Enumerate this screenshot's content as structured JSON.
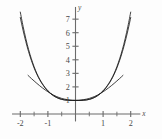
{
  "chart_data": {
    "type": "line",
    "title": "",
    "subtitle": "",
    "xlabel": "x",
    "ylabel": "y",
    "xlim": [
      -2.3,
      2.35
    ],
    "ylim": [
      -0.55,
      7.9
    ],
    "grid": false,
    "legend": "none",
    "x_ticks_major": [
      -2,
      -1,
      1,
      2
    ],
    "x_tick_labels": [
      "-2",
      "-1",
      "1",
      "2"
    ],
    "x_ticks_minor": [
      -1.5,
      -0.5,
      0.5,
      1.5
    ],
    "y_ticks_major": [
      1,
      2,
      3,
      4,
      5,
      6,
      7
    ],
    "y_tick_labels": [
      "1",
      "2",
      "3",
      "4",
      "5",
      "6",
      "7"
    ],
    "annotations": [
      {
        "name": "common-point",
        "x": 0,
        "y": 1,
        "text": ""
      }
    ],
    "series": [
      {
        "name": "curve-outer",
        "color": "#1d1d1d",
        "x": [
          -2.0,
          -1.9,
          -1.8,
          -1.7,
          -1.6,
          -1.5,
          -1.4,
          -1.3,
          -1.2,
          -1.1,
          -1.0,
          -0.9,
          -0.8,
          -0.7,
          -0.6,
          -0.5,
          -0.4,
          -0.3,
          -0.2,
          -0.1,
          0.0,
          0.1,
          0.2,
          0.3,
          0.4,
          0.5,
          0.6,
          0.7,
          0.8,
          0.9,
          1.0,
          1.1,
          1.2,
          1.3,
          1.4,
          1.5,
          1.6,
          1.7,
          1.8,
          1.9,
          2.0
        ],
        "y": [
          7.52,
          6.48,
          5.56,
          4.76,
          4.08,
          3.49,
          2.99,
          2.58,
          2.24,
          1.95,
          1.72,
          1.52,
          1.36,
          1.24,
          1.15,
          1.08,
          1.04,
          1.02,
          1.01,
          1.0,
          1.0,
          1.0,
          1.01,
          1.02,
          1.04,
          1.08,
          1.15,
          1.24,
          1.36,
          1.52,
          1.72,
          1.95,
          2.24,
          2.58,
          2.99,
          3.49,
          4.08,
          4.76,
          5.56,
          6.48,
          7.52
        ]
      },
      {
        "name": "curve-middle",
        "color": "#1d1d1d",
        "x": [
          -2.0,
          -1.9,
          -1.8,
          -1.7,
          -1.6,
          -1.5,
          -1.4,
          -1.3,
          -1.2,
          -1.1,
          -1.0,
          -0.9,
          -0.8,
          -0.7,
          -0.6,
          -0.5,
          -0.4,
          -0.3,
          -0.2,
          -0.1,
          0.0,
          0.1,
          0.2,
          0.3,
          0.4,
          0.5,
          0.6,
          0.7,
          0.8,
          0.9,
          1.0,
          1.1,
          1.2,
          1.3,
          1.4,
          1.5,
          1.6,
          1.7,
          1.8,
          1.9,
          2.0
        ],
        "y": [
          7.12,
          6.18,
          5.34,
          4.6,
          3.96,
          3.4,
          2.93,
          2.53,
          2.2,
          1.92,
          1.69,
          1.5,
          1.35,
          1.23,
          1.14,
          1.08,
          1.04,
          1.02,
          1.0,
          1.0,
          1.0,
          1.0,
          1.0,
          1.02,
          1.04,
          1.08,
          1.14,
          1.23,
          1.35,
          1.5,
          1.69,
          1.92,
          2.2,
          2.53,
          2.93,
          3.4,
          3.96,
          4.6,
          5.34,
          6.18,
          7.12
        ]
      },
      {
        "name": "curve-shallow",
        "color": "#1d1d1d",
        "x": [
          -1.72,
          -1.6,
          -1.5,
          -1.4,
          -1.3,
          -1.2,
          -1.1,
          -1.0,
          -0.9,
          -0.8,
          -0.7,
          -0.6,
          -0.5,
          -0.4,
          -0.3,
          -0.2,
          -0.1,
          0.0,
          0.1,
          0.2,
          0.3,
          0.4,
          0.5,
          0.6,
          0.7,
          0.8,
          0.9,
          1.0,
          1.1,
          1.2,
          1.3,
          1.4,
          1.5,
          1.6,
          1.72
        ],
        "y": [
          2.85,
          2.62,
          2.44,
          2.26,
          2.09,
          1.93,
          1.78,
          1.64,
          1.51,
          1.4,
          1.3,
          1.22,
          1.15,
          1.1,
          1.06,
          1.03,
          1.01,
          1.0,
          1.01,
          1.03,
          1.06,
          1.1,
          1.15,
          1.22,
          1.3,
          1.4,
          1.51,
          1.64,
          1.78,
          1.93,
          2.09,
          2.26,
          2.44,
          2.62,
          2.85
        ]
      }
    ],
    "colors": {
      "curve": "#1d1d1d",
      "axis": "#6b6b6b",
      "label": "#4a4a4a",
      "background": "#fdfdfd"
    }
  },
  "axes": {
    "x_axis_name": "x",
    "y_axis_name": "y"
  }
}
